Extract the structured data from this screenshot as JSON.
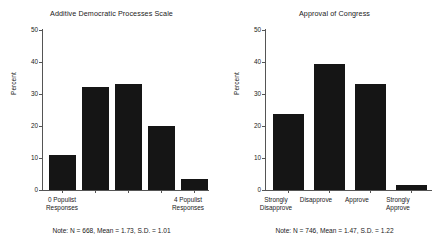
{
  "figure": {
    "background": "#ffffff",
    "bar_color": "#151515",
    "axis_color": "#555555"
  },
  "panels": [
    {
      "id": "additive-democratic-processes-scale",
      "title": "Additive Democratic Processes Scale",
      "ylabel": "Percent",
      "yticks": [
        "50",
        "40",
        "30",
        "20",
        "10",
        "0"
      ],
      "note": "Note: N = 668, Mean = 1.73, S.D. = 1.01",
      "xlabels": [
        "0 Populist\nResponses",
        "",
        "",
        "",
        "4 Populist\nResponses"
      ]
    },
    {
      "id": "approval-of-congress",
      "title": "Approval of Congress",
      "ylabel": "Percent",
      "yticks": [
        "50",
        "40",
        "30",
        "20",
        "10",
        "0"
      ],
      "note": "Note: N = 746, Mean = 1.47, S.D. = 1.22",
      "xlabels": [
        "Strongly\nDisapprove",
        "Disapprove",
        "Approve",
        "Strongly\nApprove"
      ]
    }
  ],
  "chart_data": [
    {
      "type": "bar",
      "title": "Additive Democratic Processes Scale",
      "xlabel": "",
      "ylabel": "Percent",
      "ylim": [
        0,
        50
      ],
      "ytick_values": [
        0,
        10,
        20,
        30,
        40,
        50
      ],
      "grid": false,
      "legend": "none",
      "categories": [
        "0 Populist Responses",
        "1",
        "2",
        "3",
        "4 Populist Responses"
      ],
      "values": [
        10.9,
        32.2,
        33.2,
        20.0,
        3.4
      ],
      "annotations": [
        "Note: N = 668, Mean = 1.73, S.D. = 1.01"
      ],
      "n": 668,
      "mean": 1.73,
      "sd": 1.01
    },
    {
      "type": "bar",
      "title": "Approval of Congress",
      "xlabel": "",
      "ylabel": "Percent",
      "ylim": [
        0,
        50
      ],
      "ytick_values": [
        0,
        10,
        20,
        30,
        40,
        50
      ],
      "grid": false,
      "legend": "none",
      "categories": [
        "Strongly Disapprove",
        "Disapprove",
        "Approve",
        "Strongly Approve"
      ],
      "values": [
        23.6,
        39.5,
        33.0,
        1.7
      ],
      "annotations": [
        "Note: N = 746, Mean = 1.47, S.D. = 1.22"
      ],
      "n": 746,
      "mean": 1.47,
      "sd": 1.22
    }
  ]
}
